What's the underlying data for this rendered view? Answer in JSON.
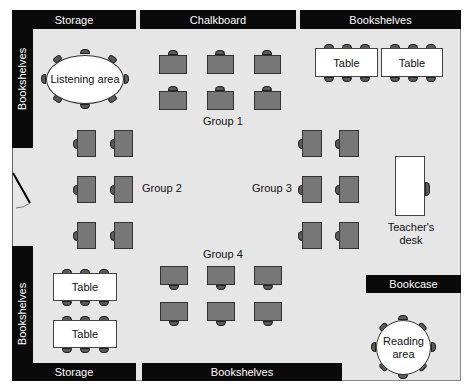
{
  "walls": {
    "top_left": "Storage",
    "top_center": "Chalkboard",
    "top_right": "Bookshelves",
    "left_top": "Bookshelves",
    "left_bottom": "Bookshelves",
    "bottom_left": "Storage",
    "bottom_center": "Bookshelves",
    "right_bookcase": "Bookcase"
  },
  "areas": {
    "listening": "Listening area",
    "reading_line1": "Reading",
    "reading_line2": "area",
    "teacher_line1": "Teacher's",
    "teacher_line2": "desk"
  },
  "tables": {
    "top_1": "Table",
    "top_2": "Table",
    "bottom_1": "Table",
    "bottom_2": "Table"
  },
  "groups": {
    "g1": "Group 1",
    "g2": "Group 2",
    "g3": "Group 3",
    "g4": "Group 4"
  },
  "colors": {
    "wall": "#0a0a0a",
    "floor": "#e6e6e6",
    "desk": "#777777",
    "chair": "#5a5a5a",
    "furniture": "#ffffff"
  }
}
